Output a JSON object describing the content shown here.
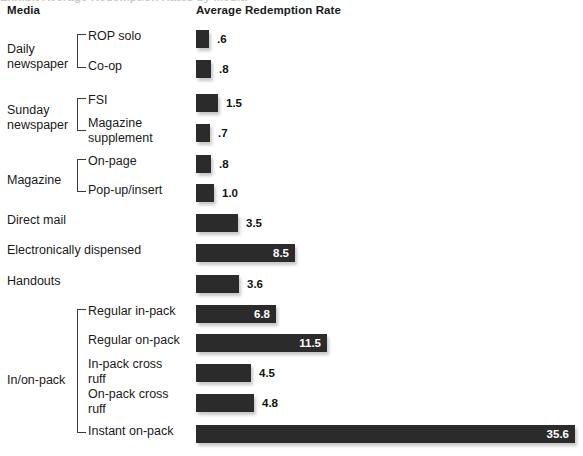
{
  "header": {
    "media_label": "Media",
    "rate_label": "Average Redemption Rate",
    "cropped_title_remnant": "Exhibit  Average Redemption Rates by Media"
  },
  "chart_data": {
    "type": "bar",
    "orientation": "horizontal",
    "title": "Average Redemption Rate",
    "xlabel": "Average Redemption Rate",
    "ylabel": "Media",
    "grid": false,
    "legend": false,
    "xlim": [
      0,
      35.6
    ],
    "value_unit": "percent",
    "categories": [
      "ROP solo",
      "Co-op",
      "FSI",
      "Magazine supplement",
      "On-page",
      "Pop-up/insert",
      "Direct mail",
      "Electronically dispensed",
      "Handouts",
      "Regular in-pack",
      "Regular on-pack",
      "In-pack cross ruff",
      "On-pack cross ruff",
      "Instant on-pack"
    ],
    "values": [
      0.6,
      0.8,
      1.5,
      0.7,
      0.8,
      1.0,
      3.5,
      8.5,
      3.6,
      6.8,
      11.5,
      4.5,
      4.8,
      35.6
    ],
    "value_labels": [
      ".6",
      ".8",
      "1.5",
      ".7",
      ".8",
      "1.0",
      "3.5",
      "8.5",
      "3.6",
      "6.8",
      "11.5",
      "4.5",
      "4.8",
      "35.6"
    ],
    "groups": [
      {
        "label": "Daily\nnewspaper",
        "children": [
          "ROP solo",
          "Co-op"
        ]
      },
      {
        "label": "Sunday\nnewspaper",
        "children": [
          "FSI",
          "Magazine supplement"
        ]
      },
      {
        "label": "Magazine",
        "children": [
          "On-page",
          "Pop-up/insert"
        ]
      },
      {
        "label": "",
        "children": [
          "Direct mail"
        ]
      },
      {
        "label": "",
        "children": [
          "Electronically dispensed"
        ]
      },
      {
        "label": "",
        "children": [
          "Handouts"
        ]
      },
      {
        "label": "In/on-pack",
        "children": [
          "Regular in-pack",
          "Regular on-pack",
          "In-pack cross ruff",
          "On-pack cross ruff",
          "Instant on-pack"
        ]
      }
    ],
    "colors": {
      "bar": "#2b2b2b",
      "label_outside": "#121212",
      "label_inside": "#ffffff",
      "background": "#ffffff"
    }
  },
  "rows": [
    {
      "name": "rop-solo",
      "label": "ROP solo",
      "value_label": ".6",
      "bar_w": 13,
      "top": 30,
      "label_top": 29,
      "inside": false,
      "kind": "sub"
    },
    {
      "name": "co-op",
      "label": "Co-op",
      "value_label": ".8",
      "bar_w": 15,
      "top": 60,
      "label_top": 59,
      "inside": false,
      "kind": "sub"
    },
    {
      "name": "fsi",
      "label": "FSI",
      "value_label": "1.5",
      "bar_w": 22,
      "top": 94,
      "label_top": 93,
      "inside": false,
      "kind": "sub"
    },
    {
      "name": "magazine-supplement",
      "label": "Magazine\nsupplement",
      "value_label": ".7",
      "bar_w": 14,
      "top": 124,
      "label_top": 116,
      "inside": false,
      "kind": "sub"
    },
    {
      "name": "on-page",
      "label": "On-page",
      "value_label": ".8",
      "bar_w": 15,
      "top": 155,
      "label_top": 154,
      "inside": false,
      "kind": "sub"
    },
    {
      "name": "pop-up-insert",
      "label": "Pop-up/insert",
      "value_label": "1.0",
      "bar_w": 18,
      "top": 184,
      "label_top": 183,
      "inside": false,
      "kind": "sub"
    },
    {
      "name": "direct-mail",
      "label": "Direct mail",
      "value_label": "3.5",
      "bar_w": 42,
      "top": 214,
      "label_top": 213,
      "inside": false,
      "kind": "flat"
    },
    {
      "name": "electronically-dispensed",
      "label": "Electronically dispensed",
      "value_label": "8.5",
      "bar_w": 99,
      "top": 244,
      "label_top": 243,
      "inside": true,
      "kind": "flat"
    },
    {
      "name": "handouts",
      "label": "Handouts",
      "value_label": "3.6",
      "bar_w": 43,
      "top": 275,
      "label_top": 274,
      "inside": false,
      "kind": "flat"
    },
    {
      "name": "regular-in-pack",
      "label": "Regular in-pack",
      "value_label": "6.8",
      "bar_w": 80,
      "top": 305,
      "label_top": 304,
      "inside": true,
      "kind": "sub"
    },
    {
      "name": "regular-on-pack",
      "label": "Regular on-pack",
      "value_label": "11.5",
      "bar_w": 131,
      "top": 334,
      "label_top": 333,
      "inside": true,
      "kind": "sub"
    },
    {
      "name": "in-pack-cross-ruff",
      "label": "In-pack cross\nruff",
      "value_label": "4.5",
      "bar_w": 55,
      "top": 364,
      "label_top": 357,
      "inside": false,
      "kind": "sub"
    },
    {
      "name": "on-pack-cross-ruff",
      "label": "On-pack cross\nruff",
      "value_label": "4.8",
      "bar_w": 58,
      "top": 394,
      "label_top": 387,
      "inside": false,
      "kind": "sub"
    },
    {
      "name": "instant-on-pack",
      "label": "Instant on-pack",
      "value_label": "35.6",
      "bar_w": 379,
      "top": 425,
      "label_top": 424,
      "inside": true,
      "kind": "sub"
    }
  ],
  "group_labels": [
    {
      "name": "daily-newspaper",
      "label": "Daily\nnewspaper",
      "top": 42,
      "bracket_top": 34,
      "bracket_h": 34
    },
    {
      "name": "sunday-newspaper",
      "label": "Sunday\nnewspaper",
      "top": 103,
      "bracket_top": 98,
      "bracket_h": 33
    },
    {
      "name": "magazine",
      "label": "Magazine",
      "top": 173,
      "bracket_top": 159,
      "bracket_h": 33
    },
    {
      "name": "in-on-pack",
      "label": "In/on-pack",
      "top": 373,
      "bracket_top": 309,
      "bracket_h": 124
    }
  ]
}
